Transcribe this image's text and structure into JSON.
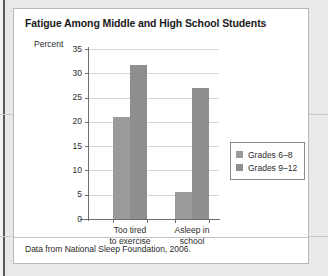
{
  "figure": {
    "title": "Fatigue Among Middle and High School Students",
    "source_note": "Data from National Sleep Foundation, 2006."
  },
  "legend": {
    "position": "right",
    "entries": [
      {
        "label": "Grades 6–8",
        "color": "#9a9a9a"
      },
      {
        "label": "Grades 9–12",
        "color": "#8e8e8e"
      }
    ]
  },
  "axes": {
    "y_title": "Percent",
    "y_ticks": [
      "0",
      "5",
      "10",
      "15",
      "20",
      "25",
      "30",
      "35"
    ],
    "x_labels": [
      {
        "line1": "Too tired",
        "line2": "to exercise"
      },
      {
        "line1": "Asleep in",
        "line2": "school"
      }
    ]
  },
  "chart_data": {
    "type": "bar",
    "title": "Fatigue Among Middle and High School Students",
    "xlabel": "",
    "ylabel": "Percent",
    "ylim": [
      0,
      35
    ],
    "ytick_step": 5,
    "grid": true,
    "legend_position": "right",
    "categories": [
      "Too tired to exercise",
      "Asleep in school"
    ],
    "series": [
      {
        "name": "Grades 6–8",
        "color": "#9a9a9a",
        "values": [
          21,
          5.5
        ]
      },
      {
        "name": "Grades 9–12",
        "color": "#8e8e8e",
        "values": [
          31.7,
          27
        ]
      }
    ],
    "annotations": [
      "Data from National Sleep Foundation, 2006."
    ]
  }
}
